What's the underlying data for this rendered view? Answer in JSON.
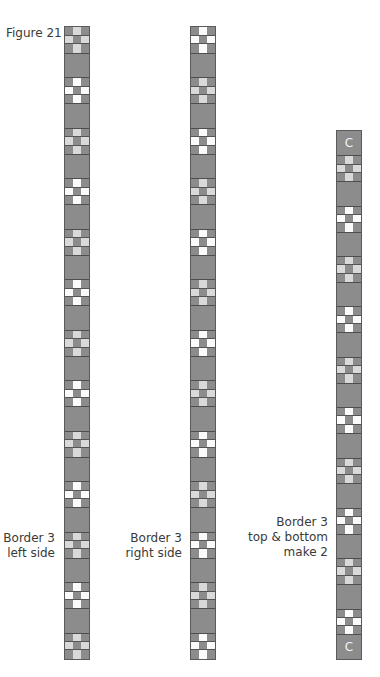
{
  "figure": {
    "title": "Figure 21",
    "strips": [
      {
        "id": "left",
        "label_lines": [
          "Border 3",
          "left side"
        ],
        "x": 64,
        "top": 26,
        "bottom": 660,
        "segments": [
          "nine-gray",
          "sash",
          "nine-white",
          "sash",
          "nine-gray",
          "sash",
          "nine-white",
          "sash",
          "nine-gray",
          "sash",
          "nine-white",
          "sash",
          "nine-gray",
          "sash",
          "nine-white",
          "sash",
          "nine-gray",
          "sash",
          "nine-white",
          "sash",
          "nine-gray",
          "sash",
          "nine-white",
          "sash",
          "nine-gray"
        ]
      },
      {
        "id": "right",
        "label_lines": [
          "Border 3",
          "right side"
        ],
        "x": 190,
        "top": 26,
        "bottom": 660,
        "segments": [
          "nine-white",
          "sash",
          "nine-gray",
          "sash",
          "nine-white",
          "sash",
          "nine-gray",
          "sash",
          "nine-white",
          "sash",
          "nine-gray",
          "sash",
          "nine-white",
          "sash",
          "nine-gray",
          "sash",
          "nine-white",
          "sash",
          "nine-gray",
          "sash",
          "nine-white",
          "sash",
          "nine-gray",
          "sash",
          "nine-white"
        ]
      },
      {
        "id": "top-bottom",
        "label_lines": [
          "Border 3",
          "top & bottom",
          "make 2"
        ],
        "x": 336,
        "top": 130,
        "bottom": 660,
        "segments": [
          "C",
          "nine-gray",
          "sash",
          "nine-white",
          "sash",
          "nine-gray",
          "sash",
          "nine-white",
          "sash",
          "nine-gray",
          "sash",
          "nine-white",
          "sash",
          "nine-gray",
          "sash",
          "nine-white",
          "sash",
          "nine-gray",
          "sash",
          "nine-white",
          "C"
        ]
      }
    ],
    "cornerstone_label": "C"
  },
  "colors": {
    "fabric_dark": "#8c8c8c",
    "fabric_light_gray": "#d9d9d9",
    "fabric_white": "#fbfbfb",
    "seam": "#4e4e4e"
  }
}
